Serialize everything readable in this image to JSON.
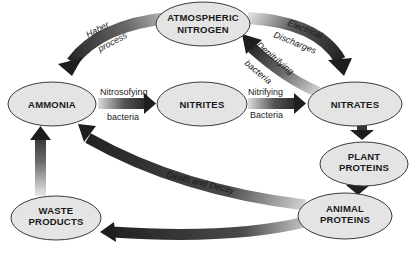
{
  "diagram": {
    "type": "cycle",
    "topic": "nitrogen cycle",
    "nodes": [
      {
        "id": "atmospheric_nitrogen",
        "line1": "ATMOSPHERIC",
        "line2": "NITROGEN"
      },
      {
        "id": "ammonia",
        "line1": "AMMONIA"
      },
      {
        "id": "nitrites",
        "line1": "NITRITES"
      },
      {
        "id": "nitrates",
        "line1": "NITRATES"
      },
      {
        "id": "plant_proteins",
        "line1": "PLANT",
        "line2": "PROTEINS"
      },
      {
        "id": "animal_proteins",
        "line1": "ANIMAL",
        "line2": "PROTEINS"
      },
      {
        "id": "waste_products",
        "line1": "WASTE",
        "line2": "PRODUCTS"
      }
    ],
    "edges": [
      {
        "from": "atmospheric_nitrogen",
        "to": "ammonia",
        "line1": "Haber",
        "line2": "process"
      },
      {
        "from": "atmospheric_nitrogen",
        "to": "nitrates",
        "line1": "Electrical",
        "line2": "Discharges"
      },
      {
        "from": "nitrates",
        "to": "atmospheric_nitrogen",
        "line1": "Denitrifying",
        "line2": "bacteria"
      },
      {
        "from": "ammonia",
        "to": "nitrites",
        "line1": "Nitrosofying",
        "line2": "bacteria"
      },
      {
        "from": "nitrites",
        "to": "nitrates",
        "line1": "Nitrifying",
        "line2": "Bacteria"
      },
      {
        "from": "nitrates",
        "to": "plant_proteins"
      },
      {
        "from": "plant_proteins",
        "to": "animal_proteins"
      },
      {
        "from": "animal_proteins",
        "to": "ammonia",
        "line1": "Death and Decay"
      },
      {
        "from": "animal_proteins",
        "to": "waste_products"
      },
      {
        "from": "waste_products",
        "to": "ammonia"
      }
    ]
  },
  "colors": {
    "node_fill": "#e4e4e4",
    "node_stroke": "#3a3a3a",
    "arrow_dark": "#1e1e1e",
    "arrow_light": "#d8d8d8",
    "text": "#1a1a1a"
  }
}
